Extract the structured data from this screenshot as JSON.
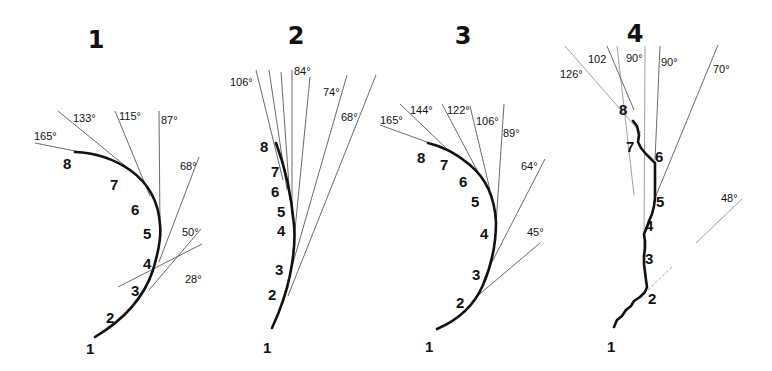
{
  "figure": {
    "panels": [
      {
        "id": "1",
        "title": "1",
        "points": [
          "1",
          "2",
          "3",
          "4",
          "5",
          "6",
          "7",
          "8"
        ],
        "angles": [
          "28°",
          "50°",
          "68°",
          "87°",
          "115°",
          "133°",
          "165°"
        ]
      },
      {
        "id": "2",
        "title": "2",
        "points": [
          "1",
          "2",
          "3",
          "4",
          "5",
          "6",
          "7",
          "8"
        ],
        "angles": [
          "68°",
          "74°",
          "84°",
          "106°"
        ]
      },
      {
        "id": "3",
        "title": "3",
        "points": [
          "1",
          "2",
          "3",
          "4",
          "5",
          "6",
          "7",
          "8"
        ],
        "angles": [
          "45°",
          "64°",
          "89°",
          "106°",
          "122°",
          "144°",
          "165°"
        ]
      },
      {
        "id": "4",
        "title": "4",
        "points": [
          "1",
          "2",
          "3",
          "4",
          "5",
          "6",
          "7",
          "8"
        ],
        "angles": [
          "48°",
          "70°",
          "90°",
          "90°",
          "102",
          "126°"
        ]
      }
    ]
  }
}
